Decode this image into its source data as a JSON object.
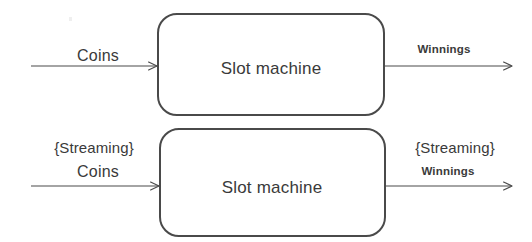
{
  "diagram": {
    "stroke_color": "#4a4a4a",
    "text_color": "#3a3a3a",
    "background_color": "#ffffff",
    "rows": [
      {
        "id": "batch",
        "box_label": "Slot machine",
        "input": {
          "qualifier": "",
          "label": "Coins"
        },
        "output": {
          "qualifier": "",
          "label": "Winnings"
        }
      },
      {
        "id": "streaming",
        "box_label": "Slot machine",
        "input": {
          "qualifier": "{Streaming}",
          "label": "Coins"
        },
        "output": {
          "qualifier": "{Streaming}",
          "label": "Winnings"
        }
      }
    ]
  }
}
